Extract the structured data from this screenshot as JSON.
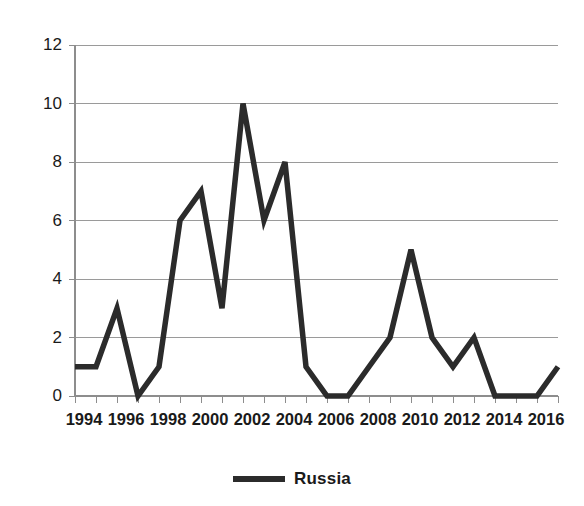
{
  "chart_data": {
    "type": "line",
    "title": "",
    "xlabel": "",
    "ylabel": "",
    "x": [
      1994,
      1995,
      1996,
      1997,
      1998,
      1999,
      2000,
      2001,
      2002,
      2003,
      2004,
      2005,
      2006,
      2007,
      2008,
      2009,
      2010,
      2011,
      2012,
      2013,
      2014,
      2015,
      2016,
      2017
    ],
    "series": [
      {
        "name": "Russia",
        "color": "#2b2b2b",
        "values": [
          1,
          1,
          3,
          0,
          1,
          6,
          7,
          3,
          10,
          6,
          8,
          1,
          0,
          0,
          1,
          2,
          5,
          2,
          1,
          2,
          0,
          0,
          0,
          1
        ]
      }
    ],
    "xlim": [
      1994,
      2017
    ],
    "ylim": [
      0,
      12
    ],
    "yticks": [
      0,
      2,
      4,
      6,
      8,
      10,
      12
    ],
    "ytick_labels": [
      "0",
      "2",
      "4",
      "6",
      "8",
      "10",
      "12"
    ],
    "xticks": [
      1994,
      1996,
      1998,
      2000,
      2002,
      2004,
      2006,
      2008,
      2010,
      2012,
      2014,
      2016
    ],
    "xtick_labels": [
      "1994",
      "1996",
      "1998",
      "2000",
      "2002",
      "2004",
      "2006",
      "2008",
      "2010",
      "2012",
      "2014",
      "2016"
    ],
    "grid": "horizontal",
    "legend_position": "bottom"
  },
  "legend": {
    "entries": [
      {
        "label": "Russia",
        "color": "#2b2b2b"
      }
    ]
  }
}
